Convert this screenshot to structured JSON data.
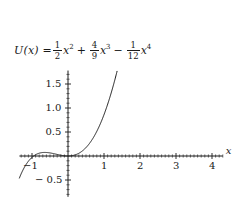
{
  "figure": {
    "kind": "function-plot",
    "background_color": "#ffffff",
    "ink_color": "#1a1a1a"
  },
  "formula": {
    "lhs": "U(x) =",
    "terms": [
      {
        "sign": "",
        "num": "1",
        "den": "2",
        "var": "x",
        "power": "2"
      },
      {
        "sign": "+",
        "num": "4",
        "den": "9",
        "var": "x",
        "power": "3"
      },
      {
        "sign": "−",
        "num": "1",
        "den": "12",
        "var": "x",
        "power": "4"
      }
    ],
    "plain": "U(x) = 1/2 x^2 + 4/9 x^3 - 1/12 x^4"
  },
  "chart_data": {
    "type": "line",
    "xlabel": "x",
    "ylabel": "",
    "xlim": [
      -1.35,
      4.3
    ],
    "ylim": [
      -0.85,
      1.78
    ],
    "grid": false,
    "legend": null,
    "xticks": [
      -1,
      1,
      2,
      3,
      4
    ],
    "xtick_labels": [
      "−1",
      "1",
      "2",
      "3",
      "4"
    ],
    "yticks": [
      -0.5,
      0.5,
      1.0,
      1.5
    ],
    "ytick_labels": [
      "− 0.5",
      "0.5",
      "1.0",
      "1.5"
    ],
    "minor_tick_step": 0.1,
    "axis_arrow": false,
    "series": [
      {
        "name": "U(x)",
        "color": "#1a1a1a",
        "linewidth": 1,
        "x": [
          -1.3,
          -1.2,
          -1.1,
          -1.0,
          -0.9,
          -0.8,
          -0.7,
          -0.6,
          -0.5,
          -0.4,
          -0.3,
          -0.2,
          -0.1,
          0.0,
          0.1,
          0.2,
          0.3,
          0.4,
          0.5,
          0.6,
          0.7,
          0.8,
          0.9,
          1.0,
          1.1,
          1.2,
          1.3,
          1.4,
          1.5,
          1.6,
          1.7,
          1.8,
          1.9,
          2.0,
          2.1,
          2.2,
          2.3,
          2.4,
          2.5,
          2.6,
          2.7,
          2.8,
          2.9,
          3.0,
          3.1,
          3.2,
          3.3,
          3.4,
          3.5,
          3.6,
          3.7,
          3.8,
          3.9,
          4.0,
          4.05
        ],
        "y": [
          1.675,
          1.373,
          1.109,
          0.88,
          0.683,
          0.516,
          0.376,
          0.261,
          0.168,
          0.096,
          0.043,
          0.0085,
          0.0046,
          0.0,
          0.0054,
          0.0234,
          0.0553,
          0.1021,
          0.1649,
          0.2443,
          0.3409,
          0.4549,
          0.5862,
          0.7345,
          0.8991,
          1.079,
          1.273,
          1.4795,
          1.6966,
          1.9221,
          2.1534,
          2.3877,
          2.6218,
          2.8521,
          3.0748,
          3.2859,
          3.4807,
          3.6546,
          3.8021,
          3.9179,
          3.996,
          4.0302,
          4.0141,
          3.9406,
          3.8026,
          3.5925,
          3.3024,
          2.9243,
          2.4496,
          1.8697,
          1.1756,
          0.3578,
          -0.5931,
          -1.6875,
          -2.2773
        ],
        "y_actual_note": "values below are the true U(x); the plotted curve uses U(x) directly",
        "y_true": [
          1.6747,
          1.3735,
          1.1091,
          0.8796,
          0.6829,
          0.5163,
          0.3775,
          0.2635,
          0.1714,
          0.0983,
          0.0414,
          0.0015,
          0.0046,
          0.0,
          0.0054,
          0.0234,
          0.0554,
          0.1021,
          0.1649,
          0.2443,
          0.3409,
          0.4549,
          0.5862,
          0.7345,
          0.8991,
          1.079,
          1.273,
          1.4795,
          1.6966,
          1.9221,
          2.1534,
          2.3877,
          2.6218,
          2.8521,
          3.0748,
          3.2859,
          3.4807,
          3.6546,
          3.8021,
          3.9179,
          3.996,
          4.0302,
          4.0141,
          3.9406,
          3.8026,
          3.5925,
          3.3024,
          2.9243,
          2.4496,
          1.8697,
          1.1756,
          0.3578,
          -0.5931,
          -1.6875,
          -2.2773
        ]
      }
    ],
    "features": {
      "local_minimum_at_origin": {
        "x": 0.0,
        "y": 0.0
      },
      "local_maximum": {
        "x": 1.0,
        "y": 0.28
      },
      "global_minimum_visible": {
        "x": 3.0,
        "y": -0.75
      },
      "zero_crossings_visible": [
        0.0,
        1.62,
        3.72
      ]
    }
  },
  "axes": {
    "x_axis_label": "x",
    "y_axis_label": ""
  }
}
